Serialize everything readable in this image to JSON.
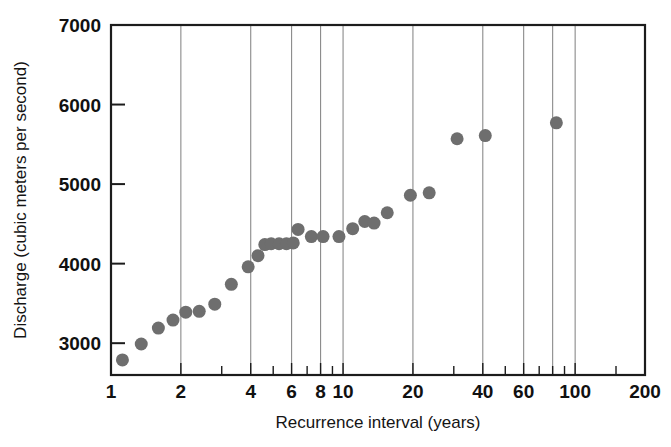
{
  "chart_data": {
    "type": "scatter",
    "title": "",
    "xlabel": "Recurrence interval (years)",
    "ylabel": "Discharge (cubic meters per second)",
    "xscale": "log",
    "yscale": "linear",
    "xlim": [
      1,
      200
    ],
    "ylim": [
      2600,
      7000
    ],
    "xticks": [
      1,
      2,
      4,
      6,
      8,
      10,
      20,
      40,
      60,
      100,
      200
    ],
    "xtick_labels": [
      "1",
      "2",
      "4",
      "6",
      "8",
      "10",
      "20",
      "40",
      "60",
      "100",
      "200"
    ],
    "yticks": [
      3000,
      4000,
      5000,
      6000,
      7000
    ],
    "ytick_labels": [
      "3000",
      "4000",
      "5000",
      "6000",
      "7000"
    ],
    "grid": "vertical-only",
    "legend": "none",
    "marker": "filled-circle",
    "marker_color": "#6e6e6e",
    "marker_size_px": 13,
    "points": [
      {
        "x": 1.12,
        "y": 2790
      },
      {
        "x": 1.35,
        "y": 2990
      },
      {
        "x": 1.6,
        "y": 3190
      },
      {
        "x": 1.85,
        "y": 3290
      },
      {
        "x": 2.1,
        "y": 3390
      },
      {
        "x": 2.4,
        "y": 3400
      },
      {
        "x": 2.8,
        "y": 3490
      },
      {
        "x": 3.3,
        "y": 3740
      },
      {
        "x": 3.9,
        "y": 3960
      },
      {
        "x": 4.3,
        "y": 4100
      },
      {
        "x": 4.6,
        "y": 4240
      },
      {
        "x": 4.9,
        "y": 4250
      },
      {
        "x": 5.3,
        "y": 4250
      },
      {
        "x": 5.7,
        "y": 4250
      },
      {
        "x": 6.1,
        "y": 4260
      },
      {
        "x": 6.4,
        "y": 4430
      },
      {
        "x": 7.3,
        "y": 4340
      },
      {
        "x": 8.2,
        "y": 4340
      },
      {
        "x": 9.6,
        "y": 4340
      },
      {
        "x": 11.0,
        "y": 4440
      },
      {
        "x": 12.4,
        "y": 4530
      },
      {
        "x": 13.6,
        "y": 4510
      },
      {
        "x": 15.5,
        "y": 4640
      },
      {
        "x": 19.5,
        "y": 4860
      },
      {
        "x": 23.5,
        "y": 4890
      },
      {
        "x": 31.0,
        "y": 5570
      },
      {
        "x": 41.0,
        "y": 5610
      },
      {
        "x": 83.0,
        "y": 5770
      }
    ]
  },
  "axes": {
    "x_label": "Recurrence interval (years)",
    "y_label": "Discharge (cubic meters per second)"
  }
}
